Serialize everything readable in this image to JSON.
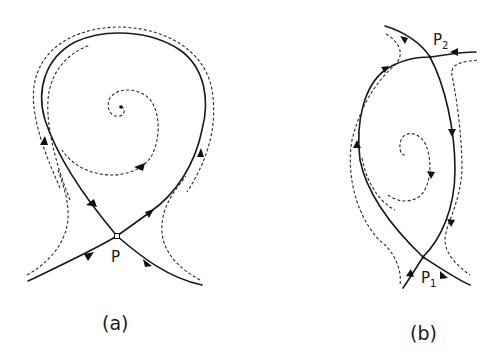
{
  "figure": {
    "panels": [
      {
        "id": "a",
        "caption": "(a)",
        "points": [
          {
            "label": "P",
            "subscript": "",
            "x": 117,
            "y": 236,
            "type": "saddle"
          }
        ],
        "features": [
          "homoclinic loop (solid)",
          "outer dashed trajectory",
          "inner dashed spiral toward focus",
          "dashed hyperbolic trajectories"
        ]
      },
      {
        "id": "b",
        "caption": "(b)",
        "points": [
          {
            "label": "P",
            "subscript": "2",
            "x": 430,
            "y": 57,
            "type": "saddle"
          },
          {
            "label": "P",
            "subscript": "1",
            "x": 423,
            "y": 257,
            "type": "saddle"
          }
        ],
        "features": [
          "heteroclinic cycle (solid)",
          "dashed outer trajectories",
          "inner dashed spiral"
        ]
      }
    ],
    "colors": {
      "line": "#1a1a1a",
      "background": "#ffffff"
    }
  }
}
